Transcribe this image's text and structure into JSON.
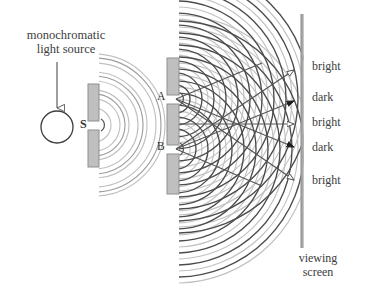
{
  "diagram": {
    "source_caption": {
      "line1": "monochromatic",
      "line2": "light source"
    },
    "source_label": "S",
    "slit_labels": {
      "top": "A",
      "bottom": "B"
    },
    "screen_caption": {
      "line1": "viewing",
      "line2": "screen"
    },
    "fringes": [
      {
        "label": "bright",
        "kind": "bright",
        "y": 68
      },
      {
        "label": "dark",
        "kind": "dark",
        "y": 99
      },
      {
        "label": "bright",
        "kind": "bright",
        "y": 124
      },
      {
        "label": "dark",
        "kind": "dark",
        "y": 149
      },
      {
        "label": "bright",
        "kind": "bright",
        "y": 182
      }
    ],
    "colors": {
      "barrier_fill": "#bfbfbf",
      "barrier_stroke": "#8a8a8a",
      "screen_line": "#9a9a9a",
      "wavefront_dark": "#4a4a4a",
      "wavefront_light": "#b8b8b8",
      "ray": "#555555",
      "text": "#3d3d3d",
      "background": "#ffffff"
    },
    "geometry": {
      "source_circle": {
        "cx": 57,
        "cy": 127,
        "r": 16
      },
      "incoming_arrow": {
        "x": 57,
        "y_top": 62,
        "y_bottom": 108
      },
      "first_barrier_x": 88,
      "first_barrier_width": 11,
      "first_slit_y": 125,
      "double_barrier_x": 167,
      "double_barrier_width": 12,
      "slit_a_y": 99,
      "slit_b_y": 149,
      "screen_x": 302,
      "screen_y_top": 14,
      "screen_y_bottom": 248
    }
  }
}
